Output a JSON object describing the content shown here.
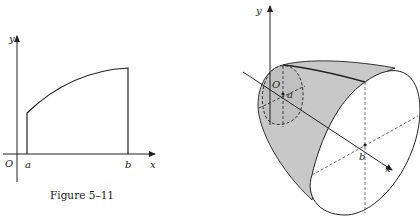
{
  "left_figure": {
    "caption": "Figure 5–11",
    "labels": {
      "y_axis": "y",
      "x_axis": "x",
      "origin": "O",
      "a": "a",
      "b": "b"
    }
  },
  "right_figure": {
    "caption": "",
    "labels": {
      "y_axis": "y",
      "x_axis": "x",
      "origin": "O",
      "a": "a",
      "b": "b"
    }
  },
  "colors": {
    "line": "#222222",
    "shade": "#c8c8c8",
    "background": "#ffffff"
  }
}
